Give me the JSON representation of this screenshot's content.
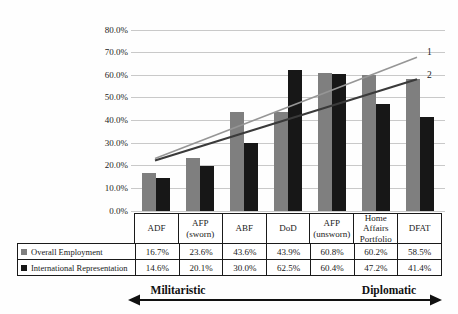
{
  "chart_data": {
    "type": "bar",
    "title": "",
    "categories": [
      "ADF",
      "AFP (sworn)",
      "ABF",
      "DoD",
      "AFP (unsworn)",
      "Home Affairs Portfolio",
      "DFAT"
    ],
    "series": [
      {
        "name": "Overall Employment",
        "color": "#7f7f7f",
        "values": [
          16.7,
          23.6,
          43.6,
          43.9,
          60.8,
          60.2,
          58.5
        ]
      },
      {
        "name": "International Representation",
        "color": "#171717",
        "values": [
          14.6,
          20.1,
          30.0,
          62.5,
          60.4,
          47.2,
          41.4
        ]
      }
    ],
    "ylim": [
      0,
      80
    ],
    "y_tick_labels": [
      "80.0%",
      "70.0%",
      "60.0%",
      "50.0%",
      "40.0%",
      "30.0%",
      "20.0%",
      "10.0%",
      "0.0%"
    ],
    "grid": true,
    "gridline_color": "#c9c9c9",
    "legend_position": "table-left",
    "trendlines": [
      {
        "label": "1",
        "color": "#969696",
        "start_value": 23.2,
        "end_value": 68.0
      },
      {
        "label": "2",
        "color": "#3a3a3a",
        "start_value": 22.3,
        "end_value": 58.2
      }
    ]
  },
  "table": {
    "header_row": [
      "ADF",
      "AFP (sworn)",
      "ABF",
      "DoD",
      "AFP (unsworn)",
      "Home Affairs Portfolio",
      "DFAT"
    ],
    "rows": [
      {
        "legend_label": "Overall Employment",
        "marker_color": "#7f7f7f",
        "values": [
          "16.7%",
          "23.6%",
          "43.6%",
          "43.9%",
          "60.8%",
          "60.2%",
          "58.5%"
        ]
      },
      {
        "legend_label": "International Representation",
        "marker_color": "#171717",
        "values": [
          "14.6%",
          "20.1%",
          "30.0%",
          "62.5%",
          "60.4%",
          "47.2%",
          "41.4%"
        ]
      }
    ]
  },
  "spectrum_axis": {
    "left_label": "Militaristic",
    "right_label": "Diplomatic"
  }
}
